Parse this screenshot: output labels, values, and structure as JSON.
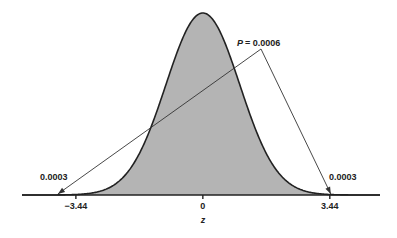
{
  "chart_data": {
    "type": "area",
    "title": "",
    "distribution": "standard normal",
    "xlabel": "z",
    "ylabel": "",
    "xlim": [
      -4.9,
      4.8
    ],
    "x_ticks": [
      {
        "value": -3.44,
        "label": "−3.44"
      },
      {
        "value": 0,
        "label": "0"
      },
      {
        "value": 3.44,
        "label": "3.44"
      }
    ],
    "shaded_region": {
      "from": -3.44,
      "to": 3.44
    },
    "annotations": {
      "total": {
        "label": "P = 0.0006",
        "p_prefix": "P",
        "value": "= 0.0006"
      },
      "left_tail": {
        "label": "0.0003",
        "x": -3.44
      },
      "right_tail": {
        "label": "0.0003",
        "x": 3.44
      }
    },
    "colors": {
      "shade": "#b4b4b4",
      "curve": "#222222",
      "axis": "#222222"
    }
  }
}
